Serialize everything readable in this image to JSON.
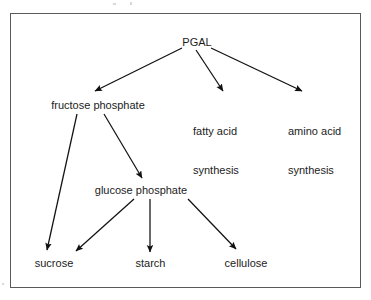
{
  "diagram": {
    "frame": {
      "stroke_color": "#5a5a5a",
      "background_color": "#ffffff"
    },
    "edge_color": "#111111",
    "text_color": "#1c1c1c",
    "nodes": [
      {
        "id": "pgal",
        "label": "PGAL",
        "x": 181,
        "y": 36,
        "width": 32,
        "align": "centered"
      },
      {
        "id": "fructose-phosphate",
        "label": "fructose phosphate",
        "x": 47,
        "y": 99,
        "width": 102,
        "align": "centered"
      },
      {
        "id": "fatty-acid",
        "line1": "fatty acid",
        "line2": "synthesis",
        "x": 193,
        "y": 99,
        "width": 56,
        "align": "left"
      },
      {
        "id": "amino-acid",
        "line1": "amino acid",
        "line2": "synthesis",
        "x": 288,
        "y": 99,
        "width": 58,
        "align": "left"
      },
      {
        "id": "glucose-phosphate",
        "label": "glucose phosphate",
        "x": 92,
        "y": 184,
        "width": 98,
        "align": "centered"
      },
      {
        "id": "sucrose",
        "label": "sucrose",
        "x": 32,
        "y": 257,
        "width": 44,
        "align": "centered"
      },
      {
        "id": "starch",
        "label": "starch",
        "x": 132,
        "y": 257,
        "width": 37,
        "align": "centered"
      },
      {
        "id": "cellulose",
        "label": "cellulose",
        "x": 221,
        "y": 257,
        "width": 50,
        "align": "centered"
      }
    ],
    "edges": [
      {
        "id": "pgal-to-fructose-phosphate",
        "from": "PGAL",
        "to": "fructose phosphate",
        "x1": 182,
        "y1": 48,
        "x2": 95,
        "y2": 91
      },
      {
        "id": "pgal-to-fatty-acid-synthesis",
        "from": "PGAL",
        "to": "fatty acid synthesis",
        "x1": 196,
        "y1": 50,
        "x2": 223,
        "y2": 91
      },
      {
        "id": "pgal-to-amino-acid-synthesis",
        "from": "PGAL",
        "to": "amino acid synthesis",
        "x1": 211,
        "y1": 48,
        "x2": 302,
        "y2": 91
      },
      {
        "id": "fructose-phosphate-to-sucrose",
        "from": "fructose phosphate",
        "to": "sucrose",
        "x1": 77,
        "y1": 114,
        "x2": 47,
        "y2": 250
      },
      {
        "id": "fructose-phosphate-to-glucose-phosphate",
        "from": "fructose phosphate",
        "to": "glucose phosphate",
        "x1": 104,
        "y1": 114,
        "x2": 142,
        "y2": 178
      },
      {
        "id": "glucose-phosphate-to-sucrose",
        "from": "glucose phosphate",
        "to": "sucrose",
        "x1": 134,
        "y1": 199,
        "x2": 76,
        "y2": 251
      },
      {
        "id": "glucose-phosphate-to-starch",
        "from": "glucose phosphate",
        "to": "starch",
        "x1": 150,
        "y1": 199,
        "x2": 150,
        "y2": 252
      },
      {
        "id": "glucose-phosphate-to-cellulose",
        "from": "glucose phosphate",
        "to": "cellulose",
        "x1": 188,
        "y1": 199,
        "x2": 236,
        "y2": 249
      }
    ]
  }
}
